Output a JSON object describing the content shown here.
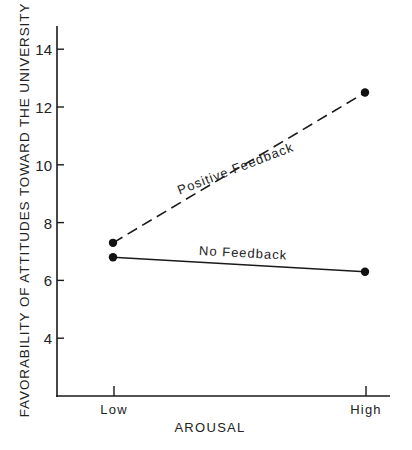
{
  "chart_data": {
    "type": "line",
    "title": "",
    "xlabel": "AROUSAL",
    "ylabel": "FAVORABILITY OF ATTITUDES TOWARD THE UNIVERSITY",
    "categories": [
      "Low",
      "High"
    ],
    "yticks": [
      "4",
      "6",
      "8",
      "10",
      "12",
      "14"
    ],
    "ylim": [
      2,
      14.8
    ],
    "grid": false,
    "legend": "inline labels on lines",
    "series": [
      {
        "name": "Positive Feedback",
        "values": [
          7.3,
          12.5
        ],
        "line_style": "dashed",
        "marker": "filled-circle"
      },
      {
        "name": "No Feedback",
        "values": [
          6.8,
          6.3
        ],
        "line_style": "solid",
        "marker": "filled-circle"
      }
    ]
  },
  "colors": {
    "ink": "#1a1a1a",
    "background": "#ffffff"
  }
}
